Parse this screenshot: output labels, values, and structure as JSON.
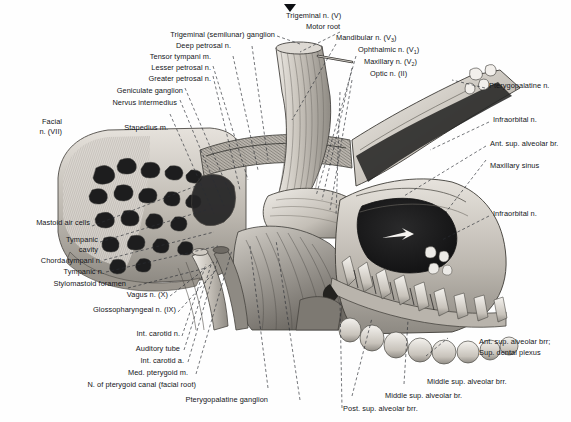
{
  "figure": {
    "domain": "anatomical-illustration",
    "style": "grayscale halftone engraving",
    "marker": "caret-down"
  },
  "labels_top_left": [
    {
      "id": "trigeminal-semilunar-ganglion",
      "text": "Trigeminal (semilunar) ganglion"
    },
    {
      "id": "deep-petrosal-n",
      "text": "Deep petrosal n."
    },
    {
      "id": "tensor-tympani-m",
      "text": "Tensor tympani m."
    },
    {
      "id": "lesser-petrosal-n",
      "text": "Lesser petrosal n."
    },
    {
      "id": "greater-petrosal-n",
      "text": "Greater petrosal n."
    },
    {
      "id": "geniculate-ganglion",
      "text": "Geniculate ganglion"
    },
    {
      "id": "nervus-intermedius",
      "text": "Nervus intermedius"
    },
    {
      "id": "stapedius-m",
      "text": "Stapedius m."
    }
  ],
  "label_facial": {
    "line1": "Facial",
    "line2": "n. (VII)"
  },
  "labels_top_right": [
    {
      "id": "trigeminal-n",
      "text": "Trigeminal n. (V)"
    },
    {
      "id": "motor-root",
      "text": "Motor root"
    },
    {
      "id": "mandibular-n",
      "text": "Mandibular n. (V",
      "sub": "3",
      "tail": ")"
    },
    {
      "id": "ophthalmic-n",
      "text": "Ophthalmic n. (V",
      "sub": "1",
      "tail": ")"
    },
    {
      "id": "maxillary-n",
      "text": "Maxillary n. (V",
      "sub": "2",
      "tail": ")"
    },
    {
      "id": "optic-n",
      "text": "Optic n. (II)"
    }
  ],
  "labels_right": [
    {
      "id": "pterygopalatine-n",
      "text": "Pterygopalatine n."
    },
    {
      "id": "infraorbital-n-upper",
      "text": "Infraorbital n."
    },
    {
      "id": "ant-sup-alveolar-br",
      "text": "Ant. sup. alveolar br."
    },
    {
      "id": "maxillary-sinus",
      "text": "Maxillary sinus"
    },
    {
      "id": "infraorbital-n-lower",
      "text": "Infraorbital n."
    }
  ],
  "labels_left": [
    {
      "id": "mastoid-air-cells",
      "text": "Mastoid air cells"
    },
    {
      "id": "tympanic-cavity",
      "line1": "Tympanic",
      "line2": "cavity"
    },
    {
      "id": "chorda-tympani-n",
      "text": "Chorda tympani n."
    },
    {
      "id": "tympanic-n",
      "text": "Tympanic n."
    },
    {
      "id": "stylomastoid-foramen",
      "text": "Stylomastoid foramen"
    },
    {
      "id": "vagus-n",
      "text": "Vagus n. (X)"
    },
    {
      "id": "glossopharyngeal-n",
      "text": "Glossopharyngeal n. (IX)"
    },
    {
      "id": "int-carotid-n",
      "text": "Int. carotid n."
    },
    {
      "id": "auditory-tube",
      "text": "Auditory tube"
    },
    {
      "id": "int-carotid-a",
      "text": "Int. carotid a."
    },
    {
      "id": "med-pterygoid-m",
      "text": "Med. pterygoid m."
    },
    {
      "id": "n-pterygoid-canal",
      "text": "N. of pterygoid canal (facial root)"
    },
    {
      "id": "pterygopalatine-ganglion",
      "text": "Pterygopalatine ganglion"
    }
  ],
  "labels_bottom_right": [
    {
      "id": "ant-sup-alveolar-brr",
      "line1": "Ant. sup. alveolar brr;",
      "line2": "Sup. dental plexus"
    },
    {
      "id": "middle-sup-alveolar-brr",
      "text": "Middle sup. alveolar brr."
    },
    {
      "id": "middle-sup-alveolar-br",
      "text": "Middle sup. alveolar br."
    },
    {
      "id": "post-sup-alveolar-brr",
      "text": "Post. sup. alveolar brr."
    }
  ],
  "colors": {
    "background": "#fefefe",
    "text": "#14161a",
    "leader": "#2a2d33",
    "bone_light": "#d9d5cf",
    "bone_mid": "#a9a49c",
    "bone_dark": "#6d6a64",
    "cavity_dark": "#1b1b1c",
    "nerve": "#b8b4ad"
  }
}
